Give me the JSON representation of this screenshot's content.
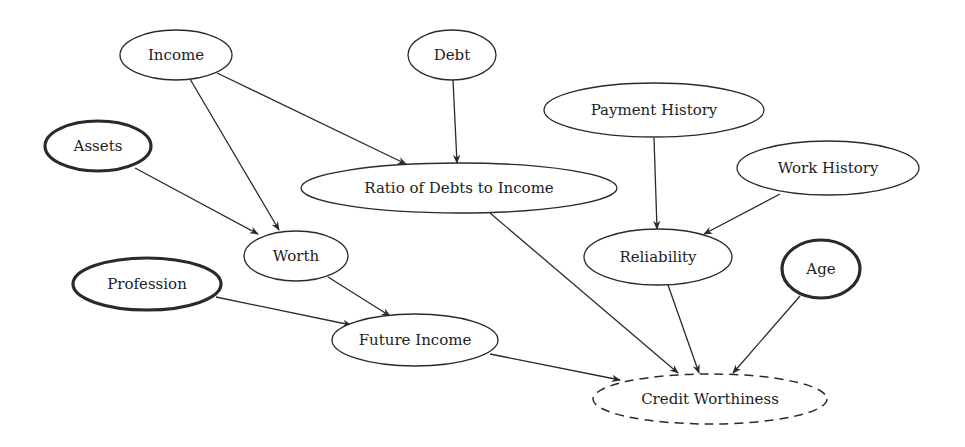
{
  "diagram": {
    "type": "bayesian-network",
    "colors": {
      "stroke": "#2a2a2a",
      "text": "#222222",
      "background": "#ffffff"
    },
    "nodes": [
      {
        "id": "income",
        "label": "Income",
        "cx": 176,
        "cy": 55,
        "rx": 56,
        "ry": 25,
        "style": "normal"
      },
      {
        "id": "debt",
        "label": "Debt",
        "cx": 452,
        "cy": 55,
        "rx": 44,
        "ry": 25,
        "style": "normal"
      },
      {
        "id": "assets",
        "label": "Assets",
        "cx": 98,
        "cy": 146,
        "rx": 53,
        "ry": 25,
        "style": "bold"
      },
      {
        "id": "ratio",
        "label": "Ratio of Debts to Income",
        "cx": 459,
        "cy": 188,
        "rx": 158,
        "ry": 25,
        "style": "normal"
      },
      {
        "id": "payment_history",
        "label": "Payment History",
        "cx": 654,
        "cy": 110,
        "rx": 110,
        "ry": 27,
        "style": "normal"
      },
      {
        "id": "work_history",
        "label": "Work History",
        "cx": 828,
        "cy": 168,
        "rx": 91,
        "ry": 27,
        "style": "normal"
      },
      {
        "id": "worth",
        "label": "Worth",
        "cx": 296,
        "cy": 256,
        "rx": 52,
        "ry": 25,
        "style": "normal"
      },
      {
        "id": "profession",
        "label": "Profession",
        "cx": 147,
        "cy": 284,
        "rx": 74,
        "ry": 26,
        "style": "bold"
      },
      {
        "id": "reliability",
        "label": "Reliability",
        "cx": 658,
        "cy": 257,
        "rx": 74,
        "ry": 28,
        "style": "normal"
      },
      {
        "id": "age",
        "label": "Age",
        "cx": 821,
        "cy": 269,
        "rx": 39,
        "ry": 29,
        "style": "bold"
      },
      {
        "id": "future_income",
        "label": "Future Income",
        "cx": 415,
        "cy": 340,
        "rx": 83,
        "ry": 26,
        "style": "normal"
      },
      {
        "id": "credit_worthiness",
        "label": "Credit Worthiness",
        "cx": 710,
        "cy": 399,
        "rx": 117,
        "ry": 25,
        "style": "dashed"
      }
    ],
    "edges": [
      {
        "from": "income",
        "to": "ratio",
        "x1": 217,
        "y1": 73,
        "x2": 406,
        "y2": 164
      },
      {
        "from": "income",
        "to": "worth",
        "x1": 190,
        "y1": 79,
        "x2": 279,
        "y2": 230
      },
      {
        "from": "debt",
        "to": "ratio",
        "x1": 453,
        "y1": 80,
        "x2": 457,
        "y2": 163
      },
      {
        "from": "assets",
        "to": "worth",
        "x1": 135,
        "y1": 168,
        "x2": 258,
        "y2": 234
      },
      {
        "from": "payment_history",
        "to": "reliability",
        "x1": 654,
        "y1": 138,
        "x2": 657,
        "y2": 229
      },
      {
        "from": "work_history",
        "to": "reliability",
        "x1": 780,
        "y1": 194,
        "x2": 704,
        "y2": 234
      },
      {
        "from": "worth",
        "to": "future_income",
        "x1": 328,
        "y1": 277,
        "x2": 390,
        "y2": 316
      },
      {
        "from": "profession",
        "to": "future_income",
        "x1": 216,
        "y1": 297,
        "x2": 351,
        "y2": 325
      },
      {
        "from": "ratio",
        "to": "credit_worthiness",
        "x1": 490,
        "y1": 213,
        "x2": 678,
        "y2": 373
      },
      {
        "from": "reliability",
        "to": "credit_worthiness",
        "x1": 668,
        "y1": 285,
        "x2": 699,
        "y2": 373
      },
      {
        "from": "age",
        "to": "credit_worthiness",
        "x1": 800,
        "y1": 296,
        "x2": 733,
        "y2": 373
      },
      {
        "from": "future_income",
        "to": "credit_worthiness",
        "x1": 490,
        "y1": 354,
        "x2": 620,
        "y2": 380
      }
    ]
  }
}
